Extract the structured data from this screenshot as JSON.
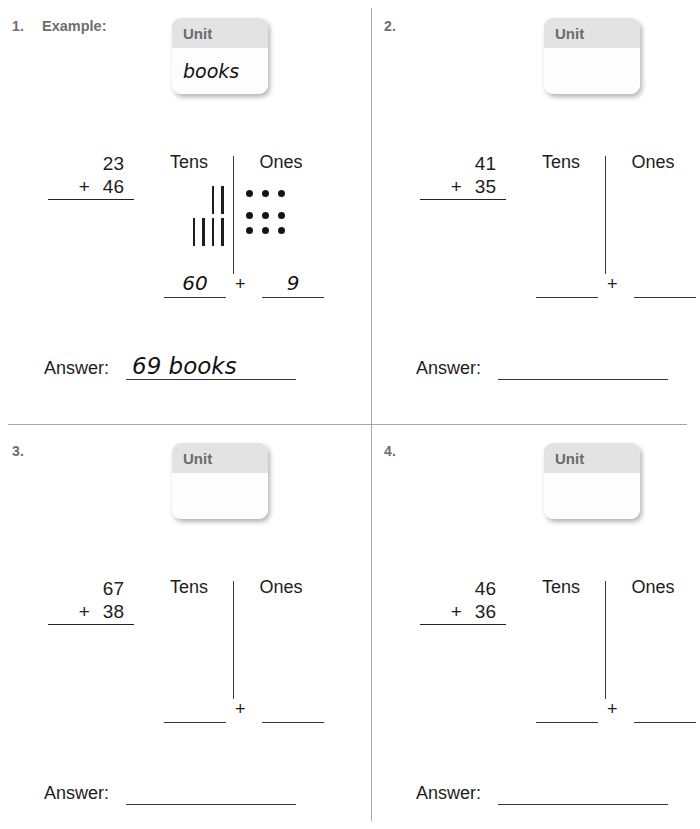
{
  "page": {
    "background_color": "#ffffff",
    "divider_color": "#a8a8a8",
    "ink_color": "#1d1d1d",
    "unit_header_color": "#e3e3e3"
  },
  "labels": {
    "unit_header": "Unit",
    "tens_header": "Tens",
    "ones_header": "Ones",
    "plus_sign": "+",
    "answer_label": "Answer:"
  },
  "problems": [
    {
      "number": "1.",
      "title": "Example:",
      "unit_value": "books",
      "addend1": "23",
      "operator": "+",
      "addend2": "46",
      "tally_rows": [
        2,
        4
      ],
      "dot_rows": [
        3,
        3,
        3
      ],
      "tens_value": "60",
      "ones_value": "9",
      "answer": "69 books"
    },
    {
      "number": "2.",
      "title": "",
      "unit_value": "",
      "addend1": "41",
      "operator": "+",
      "addend2": "35",
      "tally_rows": [],
      "dot_rows": [],
      "tens_value": "",
      "ones_value": "",
      "answer": ""
    },
    {
      "number": "3.",
      "title": "",
      "unit_value": "",
      "addend1": "67",
      "operator": "+",
      "addend2": "38",
      "tally_rows": [],
      "dot_rows": [],
      "tens_value": "",
      "ones_value": "",
      "answer": ""
    },
    {
      "number": "4.",
      "title": "",
      "unit_value": "",
      "addend1": "46",
      "operator": "+",
      "addend2": "36",
      "tally_rows": [],
      "dot_rows": [],
      "tens_value": "",
      "ones_value": "",
      "answer": ""
    }
  ]
}
